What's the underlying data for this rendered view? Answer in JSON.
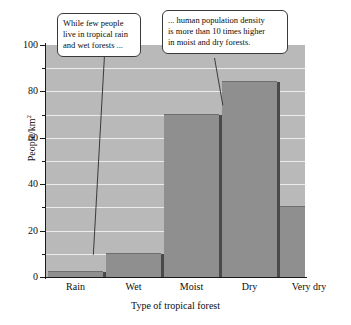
{
  "chart_data": {
    "type": "bar",
    "title": "",
    "xlabel": "Type of tropical forest",
    "ylabel": "People/km2",
    "ylabel_base": "People/km",
    "ylabel_exponent": "2",
    "categories": [
      "Rain",
      "Wet",
      "Moist",
      "Dry",
      "Very dry"
    ],
    "values": [
      2,
      10,
      70,
      84,
      30
    ],
    "ylim": [
      0,
      100
    ],
    "ytick_labels": [
      "0",
      "20",
      "40",
      "60",
      "80",
      "100"
    ],
    "ytick_values": [
      0,
      20,
      40,
      60,
      80,
      100
    ],
    "yminor_values": [
      10,
      30,
      50,
      70,
      90
    ],
    "grid": true,
    "grid_orientation": "horizontal",
    "legend": "none",
    "bar_color": "#8f8f8f",
    "plot_background": "#b9b9b9",
    "gridline_color": "#ececec",
    "axis_color": "#1a1a1a"
  },
  "annotations": [
    {
      "id": "callout-left",
      "text": "While few people live in tropical rain and wet forests ...",
      "lines": [
        "While few people",
        "live in tropical rain",
        "and wet forests ..."
      ],
      "points_to": "Wet"
    },
    {
      "id": "callout-right",
      "text": "... human population density is more than 10 times higher in moist and dry forests.",
      "lines": [
        "... human population density",
        "is more than 10 times higher",
        "in moist and dry forests."
      ],
      "points_to": "Moist"
    }
  ]
}
